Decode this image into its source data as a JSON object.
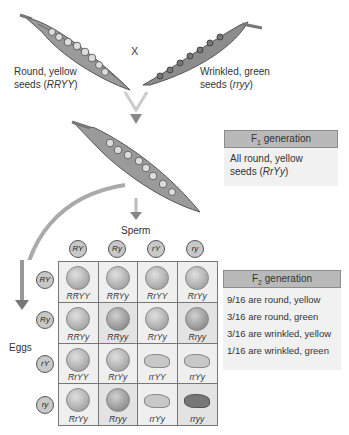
{
  "parents": {
    "left_label_line1": "Round, yellow",
    "left_label_line2_prefix": "seeds (",
    "left_genotype": "RRYY",
    "left_label_line2_suffix": ")",
    "cross_symbol": "X",
    "right_label_line1": "Wrinkled, green",
    "right_label_line2_prefix": "seeds (",
    "right_genotype": "rryy",
    "right_label_line2_suffix": ")"
  },
  "f1": {
    "title_prefix": "F",
    "title_sub": "1",
    "title_suffix": " generation",
    "line1": "All round, yellow",
    "line2_prefix": "seeds (",
    "genotype": "RrYy",
    "line2_suffix": ")"
  },
  "punnett": {
    "sperm_label": "Sperm",
    "eggs_label": "Eggs",
    "sperm_gametes": [
      "RY",
      "Ry",
      "rY",
      "ry"
    ],
    "egg_gametes": [
      "RY",
      "Ry",
      "rY",
      "ry"
    ],
    "cells": [
      [
        "RRYY",
        "RRYy",
        "RrYY",
        "RrYy"
      ],
      [
        "RRYy",
        "RRyy",
        "RrYy",
        "Rryy"
      ],
      [
        "RrYY",
        "RrYy",
        "rrYY",
        "rrYy"
      ],
      [
        "RrYy",
        "Rryy",
        "rrYy",
        "rryy"
      ]
    ]
  },
  "f2": {
    "title_prefix": "F",
    "title_sub": "2",
    "title_suffix": " generation",
    "ratios": [
      "9/16 are round, yellow",
      "3/16 are round, green",
      "3/16 are wrinkled, yellow",
      "1/16 are wrinkled, green"
    ]
  }
}
